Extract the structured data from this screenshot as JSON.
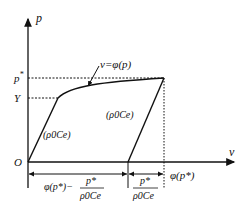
{
  "diagram": {
    "type": "stress-strain / pressure-volume loading-unloading diagram",
    "axes": {
      "y_label": "p",
      "x_label": "v",
      "origin_label": "O"
    },
    "y_ticks": {
      "p_star": "p",
      "p_star_sup": "*",
      "yield": "Y"
    },
    "curve_label": {
      "text": "v=φ(p)"
    },
    "slope_labels": {
      "loading": "(ρ0Ce)",
      "unloading": "(ρ0Ce)"
    },
    "x_annotations": {
      "right_end": "φ(p*)",
      "residual_prefix": "φ(p*)−",
      "fraction_num": "p*",
      "fraction_den": "ρ0Ce",
      "elastic_num": "p*",
      "elastic_den": "ρ0Ce"
    },
    "colors": {
      "ink": "#111111",
      "background": "#ffffff"
    }
  }
}
